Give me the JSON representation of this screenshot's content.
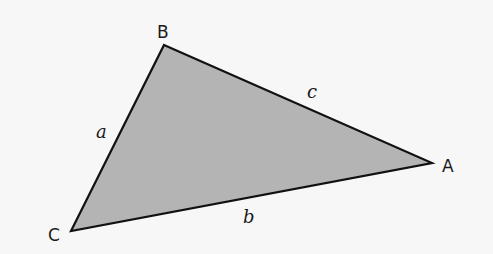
{
  "diagram": {
    "type": "triangle",
    "background": "#f7f7f7",
    "fill_color": "#b4b4b4",
    "stroke_color": "#111111",
    "vertices": [
      {
        "id": "B",
        "label": "B",
        "x": 164,
        "y": 45
      },
      {
        "id": "A",
        "label": "A",
        "x": 432,
        "y": 163
      },
      {
        "id": "C",
        "label": "C",
        "x": 71,
        "y": 231
      }
    ],
    "sides": [
      {
        "id": "a",
        "label": "a",
        "from": "B",
        "to": "C"
      },
      {
        "id": "b",
        "label": "b",
        "from": "C",
        "to": "A"
      },
      {
        "id": "c",
        "label": "c",
        "from": "B",
        "to": "A"
      }
    ]
  }
}
